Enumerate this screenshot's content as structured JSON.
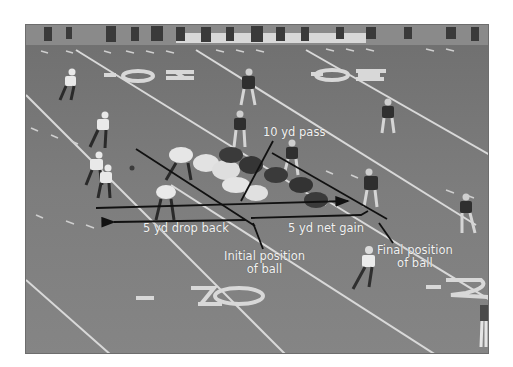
{
  "figure": {
    "annotations": {
      "pass": "10 yd pass",
      "drop_back": "5 yd drop back",
      "net_gain": "5 yd net gain",
      "initial_line1": "Initial position",
      "initial_line2": "of ball",
      "final_line1": "Final position",
      "final_line2": "of ball"
    },
    "field_numbers": {
      "top_left": "20",
      "top_right": "30",
      "bottom_left": "10",
      "bottom_right": "2"
    },
    "colors": {
      "turf": "#7b7b7b",
      "line": "#111111",
      "text": "#f2f2f2"
    }
  }
}
